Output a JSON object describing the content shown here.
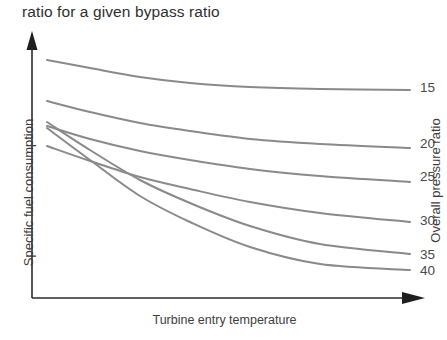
{
  "caption": "ratio for a given bypass ratio",
  "axes": {
    "ylabel": "Specific fuel consumption",
    "xlabel": "Turbine entry temperature",
    "right_label": "Overall pressure ratio"
  },
  "colors": {
    "curve": "#8a8a8a",
    "axis": "#2b2b2b",
    "text": "#3d3d3d",
    "caption": "#2f2f2f",
    "background": "#ffffff"
  },
  "chart_data": {
    "type": "line",
    "title": "ratio for a given bypass ratio",
    "xlabel": "Turbine entry temperature",
    "ylabel": "Specific fuel consumption",
    "right_axis_label": "Overall pressure ratio",
    "grid": false,
    "legend_position": "right-of-curve-ends",
    "axis_style": "arrow-axes-unlabeled-ticks",
    "xlim": [
      0,
      1
    ],
    "ylim": [
      0,
      1
    ],
    "note": "Schematic curves: specific fuel consumption falls with turbine entry temperature; each curve is one overall pressure ratio. Higher pressure ratio curves start higher and fall more steeply, crossing the lower ones.",
    "series": [
      {
        "name": "15",
        "label": "15",
        "label_x": 420,
        "label_y": 89,
        "points": [
          [
            47,
            60
          ],
          [
            90,
            68
          ],
          [
            140,
            77
          ],
          [
            190,
            83
          ],
          [
            250,
            87
          ],
          [
            320,
            89
          ],
          [
            410,
            90
          ]
        ]
      },
      {
        "name": "20",
        "label": "20",
        "label_x": 420,
        "label_y": 145,
        "points": [
          [
            47,
            101
          ],
          [
            90,
            112
          ],
          [
            140,
            123
          ],
          [
            190,
            131
          ],
          [
            250,
            139
          ],
          [
            320,
            144
          ],
          [
            410,
            148
          ]
        ]
      },
      {
        "name": "25",
        "label": "25",
        "label_x": 420,
        "label_y": 178,
        "points": [
          [
            47,
            126
          ],
          [
            90,
            139
          ],
          [
            140,
            151
          ],
          [
            190,
            160
          ],
          [
            250,
            169
          ],
          [
            320,
            176
          ],
          [
            410,
            182
          ]
        ]
      },
      {
        "name": "30",
        "label": "30",
        "label_x": 420,
        "label_y": 222,
        "points": [
          [
            47,
            146
          ],
          [
            90,
            161
          ],
          [
            140,
            177
          ],
          [
            190,
            189
          ],
          [
            250,
            202
          ],
          [
            320,
            213
          ],
          [
            410,
            222
          ]
        ]
      },
      {
        "name": "35",
        "label": "35",
        "label_x": 420,
        "label_y": 256,
        "points": [
          [
            47,
            122
          ],
          [
            90,
            150
          ],
          [
            140,
            180
          ],
          [
            190,
            203
          ],
          [
            250,
            226
          ],
          [
            320,
            244
          ],
          [
            410,
            254
          ]
        ]
      },
      {
        "name": "40",
        "label": "40",
        "label_x": 420,
        "label_y": 272,
        "points": [
          [
            47,
            128
          ],
          [
            90,
            160
          ],
          [
            140,
            196
          ],
          [
            190,
            222
          ],
          [
            250,
            247
          ],
          [
            320,
            264
          ],
          [
            410,
            270
          ]
        ]
      }
    ]
  }
}
